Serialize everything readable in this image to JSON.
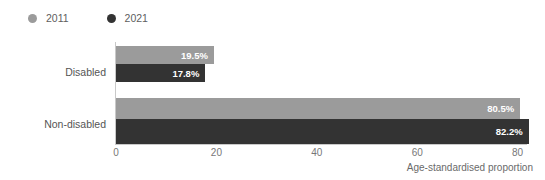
{
  "chart_data": {
    "type": "bar",
    "orientation": "horizontal",
    "title": "",
    "subtitle": "",
    "xlabel": "Age-standardised proportion",
    "ylabel": "",
    "categories": [
      "Disabled",
      "Non-disabled"
    ],
    "series": [
      {
        "name": "2011",
        "color": "#9b9b9b",
        "values": [
          19.5,
          80.5
        ],
        "labels": [
          "19.5%",
          "80.5%"
        ]
      },
      {
        "name": "2021",
        "color": "#333333",
        "values": [
          17.8,
          82.2
        ],
        "labels": [
          "17.8%",
          "82.2%"
        ]
      }
    ],
    "xlim": [
      0,
      86
    ],
    "xticks": [
      0,
      20,
      40,
      60,
      80
    ],
    "xtick_labels": [
      "0",
      "20",
      "40",
      "60",
      "80"
    ],
    "grid": false,
    "legend_position": "top-left",
    "value_label_color": "#ffffff",
    "axis_color": "#c9c9c9",
    "background": "#ffffff"
  },
  "legend": {
    "items": [
      {
        "label": "2011",
        "color": "#9b9b9b",
        "icon": "circle-marker-icon"
      },
      {
        "label": "2021",
        "color": "#333333",
        "icon": "circle-marker-icon"
      }
    ]
  },
  "axis": {
    "x_title": "Age-standardised proportion",
    "ticks": [
      "0",
      "20",
      "40",
      "60",
      "80"
    ]
  },
  "categories": [
    {
      "label": "Disabled",
      "bars": [
        {
          "series": "2011",
          "value": 19.5,
          "label": "19.5%",
          "color": "#9b9b9b"
        },
        {
          "series": "2021",
          "value": 17.8,
          "label": "17.8%",
          "color": "#333333"
        }
      ]
    },
    {
      "label": "Non-disabled",
      "bars": [
        {
          "series": "2011",
          "value": 80.5,
          "label": "80.5%",
          "color": "#9b9b9b"
        },
        {
          "series": "2021",
          "value": 82.2,
          "label": "82.2%",
          "color": "#333333"
        }
      ]
    }
  ]
}
